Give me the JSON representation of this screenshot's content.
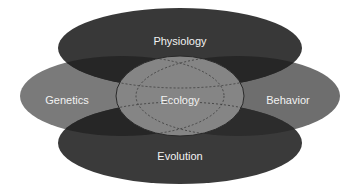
{
  "diagram": {
    "type": "overlapping-ellipses",
    "colors": {
      "background": "#ffffff",
      "dark": "#383838",
      "medium": "#7a7a7a",
      "overlap_dark": "#222222",
      "center": "#838383",
      "center_stroke": "#2a2a2a",
      "label": "#f2f2f2"
    },
    "nodes": [
      {
        "id": "physiology",
        "label": "Physiology",
        "position": "top"
      },
      {
        "id": "genetics",
        "label": "Genetics",
        "position": "left"
      },
      {
        "id": "ecology",
        "label": "Ecology",
        "position": "center"
      },
      {
        "id": "behavior",
        "label": "Behavior",
        "position": "right"
      },
      {
        "id": "evolution",
        "label": "Evolution",
        "position": "bottom"
      }
    ]
  }
}
